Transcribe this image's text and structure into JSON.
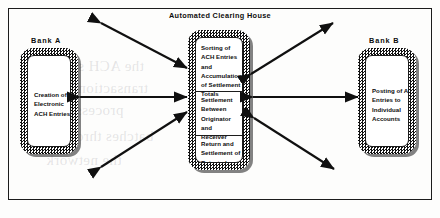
{
  "diagram": {
    "title": "Automated Clearing House",
    "frame": {
      "present": true
    },
    "bank_a": {
      "label": "Bank A",
      "body": "Creation of\nElectronic\nACH Entries"
    },
    "bank_b": {
      "label": "Bank B",
      "body": "Posting of ACH\nEntries to\nIndividual\nAccounts"
    },
    "ach_box": {
      "sections": [
        {
          "name": "sorting",
          "text": "Sorting of\nACH Entries\nand\nAccumulation\nof Settlement\nTotals"
        },
        {
          "name": "settlement",
          "text": "Settlement\nBetween\nOriginator\nand\nReceiver"
        },
        {
          "name": "returns",
          "text": "Return and\nSettlement of\nRejected\nEntries"
        }
      ]
    },
    "arrows": [
      {
        "name": "bank-a-to-ach-horizontal",
        "direction": "double",
        "orientation": "horizontal"
      },
      {
        "name": "ach-to-bank-b-horizontal",
        "direction": "double",
        "orientation": "horizontal"
      },
      {
        "name": "ach-upper-left-diagonal",
        "direction": "double",
        "orientation": "diagonal"
      },
      {
        "name": "ach-lower-left-diagonal",
        "direction": "double",
        "orientation": "diagonal"
      },
      {
        "name": "ach-upper-right-diagonal",
        "direction": "double",
        "orientation": "diagonal"
      },
      {
        "name": "ach-lower-right-diagonal",
        "direction": "double",
        "orientation": "diagonal"
      }
    ],
    "colors": {
      "ink": "#0d0d0d",
      "line": "#1c1c1c",
      "paper": "#fdfdfc"
    },
    "bleed_text": [
      "the ACH system",
      "transactions are",
      "processed in",
      "batches through",
      "the network"
    ]
  }
}
